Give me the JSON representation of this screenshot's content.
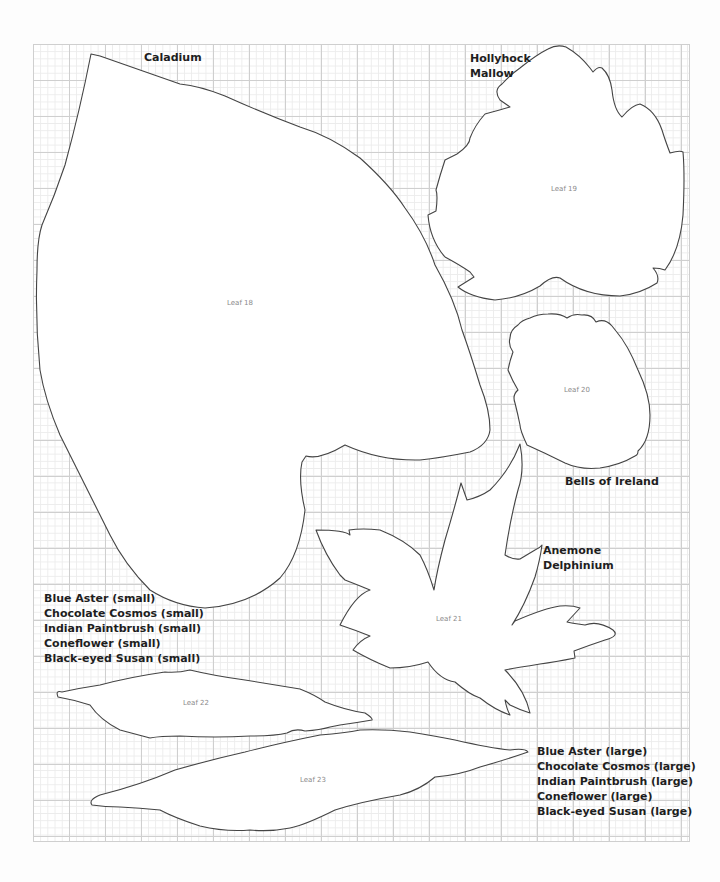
{
  "template": {
    "leaves": [
      {
        "id": "leaf-18",
        "label": "Leaf 18",
        "flower": [
          "Caladium"
        ]
      },
      {
        "id": "leaf-19",
        "label": "Leaf 19",
        "flower": [
          "Hollyhock",
          "Mallow"
        ]
      },
      {
        "id": "leaf-20",
        "label": "Leaf 20",
        "flower": [
          "Bells of Ireland"
        ]
      },
      {
        "id": "leaf-21",
        "label": "Leaf 21",
        "flower": [
          "Anemone",
          "Delphinium"
        ]
      },
      {
        "id": "leaf-22",
        "label": "Leaf 22",
        "flower": [
          "Blue Aster (small)",
          "Chocolate Cosmos (small)",
          "Indian Paintbrush (small)",
          "Coneflower (small)",
          "Black-eyed Susan (small)"
        ]
      },
      {
        "id": "leaf-23",
        "label": "Leaf 23",
        "flower": [
          "Blue Aster (large)",
          "Chocolate Cosmos (large)",
          "Indian Paintbrush (large)",
          "Coneflower (large)",
          "Black-eyed Susan (large)"
        ]
      }
    ]
  },
  "colors": {
    "outline": "#444444",
    "label_text": "#1e1e1e",
    "leaf_name_text": "#8a8a8a",
    "grid_major": "#cfcfcf",
    "grid_minor": "#ececec"
  }
}
